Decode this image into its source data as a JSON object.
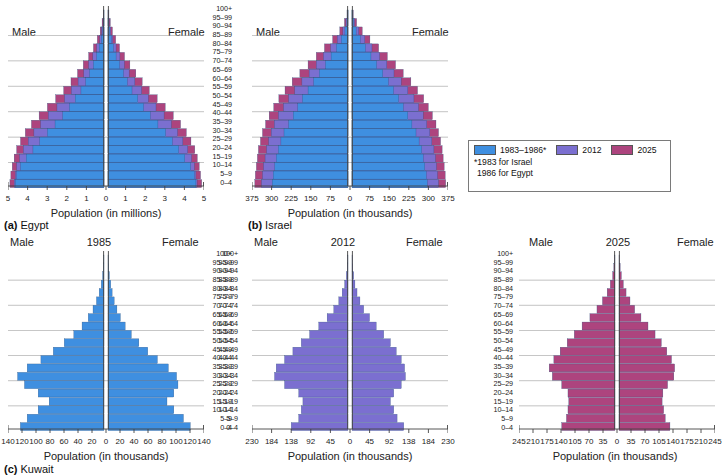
{
  "figure": {
    "age_groups": [
      "100+",
      "95–99",
      "90–94",
      "85–89",
      "80–84",
      "75–79",
      "70–74",
      "65–69",
      "60–64",
      "55–59",
      "50–54",
      "45–49",
      "40–44",
      "35–39",
      "30–34",
      "25–29",
      "20–24",
      "15–19",
      "10–14",
      "5–9",
      "0–4"
    ],
    "male_label": "Male",
    "female_label": "Female"
  },
  "legend": {
    "items": [
      {
        "label": "1983–1986*",
        "color": "#3f8fe0"
      },
      {
        "label": "2012",
        "color": "#7b6fd0"
      },
      {
        "label": "2025",
        "color": "#ad447e"
      }
    ],
    "note_line1": "*1983 for Israel",
    "note_line2": "1986 for Egypt"
  },
  "colors": {
    "blue": "#3f8fe0",
    "purple": "#7b6fd0",
    "magenta": "#ad447e",
    "gridline": "#9a9a9a",
    "axis": "#444444"
  },
  "panels": [
    {
      "id": "egypt",
      "caption_tag": "(a)",
      "caption_name": "Egypt",
      "axis_title": "Population (in millions)",
      "year_label": "",
      "ticks": [
        "5",
        "4",
        "3",
        "2",
        "1",
        "0",
        "1",
        "2",
        "3",
        "4",
        "5"
      ],
      "axis_max": 5
    },
    {
      "id": "israel",
      "caption_tag": "(b)",
      "caption_name": "Israel",
      "axis_title": "Population (in thousands)",
      "year_label": "",
      "ticks": [
        "375",
        "300",
        "225",
        "150",
        "75",
        "0",
        "75",
        "150",
        "225",
        "300",
        "375"
      ],
      "axis_max": 375
    },
    {
      "id": "kuwait-1985",
      "caption_tag": "(c)",
      "caption_name": "Kuwait",
      "axis_title": "Population (in thousands)",
      "year_label": "1985",
      "ticks": [
        "140",
        "120",
        "100",
        "80",
        "60",
        "40",
        "20",
        "0",
        "20",
        "40",
        "60",
        "80",
        "100",
        "120",
        "140"
      ],
      "axis_max": 140
    },
    {
      "id": "kuwait-2012",
      "caption_tag": "",
      "caption_name": "",
      "axis_title": "Population (in thousands)",
      "year_label": "2012",
      "ticks": [
        "230",
        "184",
        "138",
        "92",
        "45",
        "0",
        "45",
        "92",
        "138",
        "184",
        "230"
      ],
      "axis_max": 230
    },
    {
      "id": "kuwait-2025",
      "caption_tag": "",
      "caption_name": "",
      "axis_title": "Population (in thousands)",
      "year_label": "2025",
      "ticks": [
        "245",
        "210",
        "175",
        "140",
        "105",
        "70",
        "35",
        "0",
        "35",
        "70",
        "105",
        "140",
        "175",
        "210",
        "245"
      ],
      "axis_max": 245
    }
  ],
  "chart_data": [
    {
      "id": "egypt",
      "type": "bar",
      "orientation": "population-pyramid",
      "title": "(a) Egypt",
      "xlabel": "Population (in millions)",
      "ylabel": "Age group",
      "xlim": [
        -5,
        5
      ],
      "grid": true,
      "categories": [
        "100+",
        "95–99",
        "90–94",
        "85–89",
        "80–84",
        "75–79",
        "70–74",
        "65–69",
        "60–64",
        "55–59",
        "50–54",
        "45–49",
        "40–44",
        "35–39",
        "30–34",
        "25–29",
        "20–24",
        "15–19",
        "10–14",
        "5–9",
        "0–4"
      ],
      "series": [
        {
          "name": "1986",
          "color": "#3f8fe0",
          "male": [
            0.01,
            0.03,
            0.07,
            0.14,
            0.25,
            0.38,
            0.55,
            0.75,
            0.95,
            1.2,
            1.5,
            1.8,
            2.15,
            2.55,
            2.95,
            3.35,
            3.7,
            4.05,
            4.35,
            4.55,
            4.62
          ],
          "female": [
            0.01,
            0.04,
            0.09,
            0.17,
            0.28,
            0.42,
            0.6,
            0.8,
            1.0,
            1.25,
            1.55,
            1.85,
            2.2,
            2.6,
            3.0,
            3.35,
            3.68,
            4.0,
            4.3,
            4.5,
            4.58
          ]
        },
        {
          "name": "2012",
          "color": "#7b6fd0",
          "male": [
            0.02,
            0.05,
            0.12,
            0.22,
            0.38,
            0.58,
            0.8,
            1.05,
            1.35,
            1.7,
            2.05,
            2.45,
            2.9,
            3.3,
            3.65,
            3.95,
            4.2,
            4.4,
            4.55,
            4.62,
            4.68
          ],
          "female": [
            0.02,
            0.06,
            0.14,
            0.25,
            0.42,
            0.62,
            0.85,
            1.1,
            1.4,
            1.75,
            2.1,
            2.5,
            2.92,
            3.3,
            3.62,
            3.9,
            4.15,
            4.35,
            4.5,
            4.58,
            4.64
          ]
        },
        {
          "name": "2025",
          "color": "#ad447e",
          "male": [
            0.04,
            0.1,
            0.2,
            0.35,
            0.55,
            0.8,
            1.08,
            1.38,
            1.72,
            2.1,
            2.52,
            2.95,
            3.38,
            3.78,
            4.1,
            4.35,
            4.55,
            4.68,
            4.78,
            4.85,
            4.9
          ],
          "female": [
            0.05,
            0.12,
            0.23,
            0.4,
            0.6,
            0.86,
            1.14,
            1.45,
            1.78,
            2.15,
            2.56,
            2.98,
            3.4,
            3.78,
            4.08,
            4.32,
            4.52,
            4.65,
            4.75,
            4.82,
            4.88
          ]
        }
      ]
    },
    {
      "id": "israel",
      "type": "bar",
      "orientation": "population-pyramid",
      "title": "(b) Israel",
      "xlabel": "Population (in thousands)",
      "ylabel": "Age group",
      "xlim": [
        -375,
        375
      ],
      "grid": true,
      "categories": [
        "100+",
        "95–99",
        "90–94",
        "85–89",
        "80–84",
        "75–79",
        "70–74",
        "65–69",
        "60–64",
        "55–59",
        "50–54",
        "45–49",
        "40–44",
        "35–39",
        "30–34",
        "25–29",
        "20–24",
        "15–19",
        "10–14",
        "5–9",
        "0–4"
      ],
      "series": [
        {
          "name": "1983",
          "color": "#3f8fe0",
          "male": [
            1,
            4,
            12,
            26,
            45,
            66,
            88,
            112,
            134,
            156,
            178,
            196,
            214,
            232,
            250,
            262,
            272,
            280,
            286,
            292,
            296
          ],
          "female": [
            2,
            6,
            16,
            32,
            52,
            74,
            96,
            120,
            142,
            162,
            182,
            200,
            218,
            234,
            250,
            262,
            272,
            278,
            284,
            290,
            294
          ]
        },
        {
          "name": "2012",
          "color": "#7b6fd0",
          "male": [
            2,
            8,
            20,
            42,
            68,
            96,
            124,
            152,
            180,
            208,
            232,
            252,
            272,
            288,
            300,
            310,
            318,
            324,
            330,
            334,
            338
          ],
          "female": [
            3,
            10,
            26,
            50,
            78,
            108,
            136,
            164,
            192,
            218,
            242,
            260,
            278,
            292,
            304,
            312,
            320,
            326,
            330,
            334,
            338
          ]
        },
        {
          "name": "2025",
          "color": "#ad447e",
          "male": [
            4,
            14,
            32,
            60,
            92,
            124,
            156,
            188,
            218,
            246,
            270,
            290,
            308,
            322,
            334,
            342,
            350,
            354,
            358,
            362,
            364
          ],
          "female": [
            5,
            18,
            40,
            70,
            104,
            138,
            170,
            200,
            230,
            256,
            280,
            298,
            314,
            328,
            338,
            346,
            352,
            356,
            360,
            364,
            366
          ]
        }
      ]
    },
    {
      "id": "kuwait-1985",
      "type": "bar",
      "orientation": "population-pyramid",
      "title": "(c) Kuwait — 1985",
      "xlabel": "Population (in thousands)",
      "ylabel": "Age group",
      "xlim": [
        -140,
        140
      ],
      "grid": true,
      "categories": [
        "100+",
        "95–99",
        "90–94",
        "85–89",
        "80–84",
        "75–79",
        "70–74",
        "65–69",
        "60–64",
        "55–59",
        "50–54",
        "45–49",
        "40–44",
        "35–39",
        "30–34",
        "25–29",
        "20–24",
        "15–19",
        "10–14",
        "5–9",
        "0–4"
      ],
      "series": [
        {
          "name": "1985",
          "color": "#3f8fe0",
          "male": [
            0.5,
            1,
            2,
            4,
            7,
            11,
            16,
            23,
            32,
            44,
            58,
            74,
            92,
            112,
            126,
            116,
            96,
            80,
            96,
            112,
            122
          ],
          "female": [
            0.5,
            1,
            2,
            4,
            6,
            9,
            13,
            18,
            25,
            34,
            45,
            58,
            72,
            88,
            100,
            102,
            96,
            86,
            96,
            110,
            120
          ]
        }
      ]
    },
    {
      "id": "kuwait-2012",
      "type": "bar",
      "orientation": "population-pyramid",
      "title": "Kuwait — 2012",
      "xlabel": "Population (in thousands)",
      "ylabel": "Age group",
      "xlim": [
        -230,
        230
      ],
      "grid": true,
      "categories": [
        "100+",
        "95–99",
        "90–94",
        "85–89",
        "80–84",
        "75–79",
        "70–74",
        "65–69",
        "60–64",
        "55–59",
        "50–54",
        "45–49",
        "40–44",
        "35–39",
        "30–34",
        "25–29",
        "20–24",
        "15–19",
        "10–14",
        "5–9",
        "0–4"
      ],
      "series": [
        {
          "name": "2012",
          "color": "#7b6fd0",
          "male": [
            1,
            2,
            4,
            8,
            14,
            22,
            34,
            50,
            70,
            92,
            112,
            132,
            152,
            172,
            176,
            152,
            118,
            108,
            112,
            118,
            136
          ],
          "female": [
            1,
            2,
            4,
            7,
            12,
            19,
            28,
            42,
            58,
            76,
            92,
            106,
            118,
            126,
            128,
            118,
            100,
            92,
            100,
            108,
            124
          ]
        }
      ]
    },
    {
      "id": "kuwait-2025",
      "type": "bar",
      "orientation": "population-pyramid",
      "title": "Kuwait — 2025",
      "xlabel": "Population (in thousands)",
      "ylabel": "Age group",
      "xlim": [
        -245,
        245
      ],
      "grid": true,
      "categories": [
        "100+",
        "95–99",
        "90–94",
        "85–89",
        "80–84",
        "75–79",
        "70–74",
        "65–69",
        "60–64",
        "55–59",
        "50–54",
        "45–49",
        "40–44",
        "35–39",
        "30–34",
        "25–29",
        "20–24",
        "15–19",
        "10–14",
        "5–9",
        "0–4"
      ],
      "series": [
        {
          "name": "2025",
          "color": "#ad447e",
          "male": [
            1,
            3,
            6,
            12,
            20,
            32,
            46,
            64,
            84,
            104,
            122,
            140,
            156,
            168,
            160,
            136,
            120,
            118,
            120,
            124,
            136
          ],
          "female": [
            1,
            3,
            6,
            11,
            18,
            28,
            40,
            56,
            74,
            92,
            108,
            122,
            134,
            142,
            140,
            124,
            112,
            110,
            114,
            118,
            130
          ]
        }
      ]
    }
  ]
}
